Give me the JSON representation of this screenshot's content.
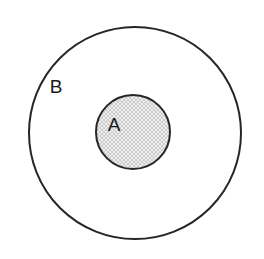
{
  "diagram": {
    "type": "euler-venn",
    "title": "",
    "background_color": "#ffffff",
    "relation": "A is a subset of B",
    "outer_set": {
      "label": "B",
      "shape": "circle",
      "center_x": 135,
      "center_y": 133,
      "radius": 106,
      "fill": "#ffffff",
      "stroke": "#262626",
      "stroke_width": 2,
      "label_x": 56,
      "label_y": 88
    },
    "inner_set": {
      "label": "A",
      "shape": "circle",
      "center_x": 133,
      "center_y": 132,
      "radius": 37,
      "fill": "hatch-pattern",
      "fill_base": "#fdfdfd",
      "hatch_color": "#c9c9c9",
      "stroke": "#262626",
      "stroke_width": 2,
      "label_x": 114,
      "label_y": 126
    }
  }
}
